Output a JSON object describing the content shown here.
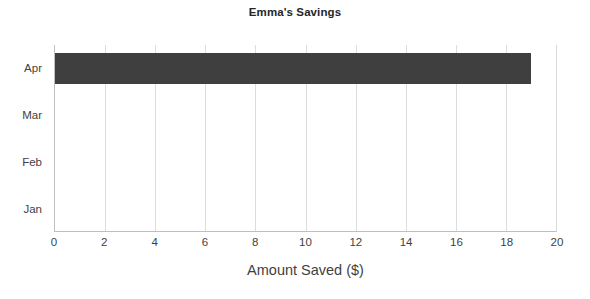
{
  "chart_data": {
    "type": "bar",
    "orientation": "horizontal",
    "title": "Emma's Savings",
    "xlabel": "Amount Saved ($)",
    "ylabel": "",
    "categories": [
      "Jan",
      "Feb",
      "Mar",
      "Apr"
    ],
    "values": [
      0,
      0,
      0,
      19
    ],
    "series": [
      {
        "name": "Amount Saved ($)",
        "values": [
          0,
          0,
          0,
          19
        ]
      }
    ],
    "xlim": [
      0,
      20
    ],
    "xticks": [
      0,
      2,
      4,
      6,
      8,
      10,
      12,
      14,
      16,
      18,
      20
    ],
    "xtick_labels": [
      "0",
      "2",
      "4",
      "6",
      "8",
      "10",
      "12",
      "14",
      "16",
      "18",
      "20"
    ],
    "ytick_labels_top_to_bottom": [
      "Apr",
      "Mar",
      "Feb",
      "Jan"
    ],
    "grid": true,
    "grid_axis": "x",
    "legend": false,
    "legend_position": "none",
    "bar_color": "#3f3f3f",
    "grid_color": "#dcdcdc",
    "axis_color": "#bfbfbf",
    "background_color": "#ffffff",
    "annotations": []
  }
}
